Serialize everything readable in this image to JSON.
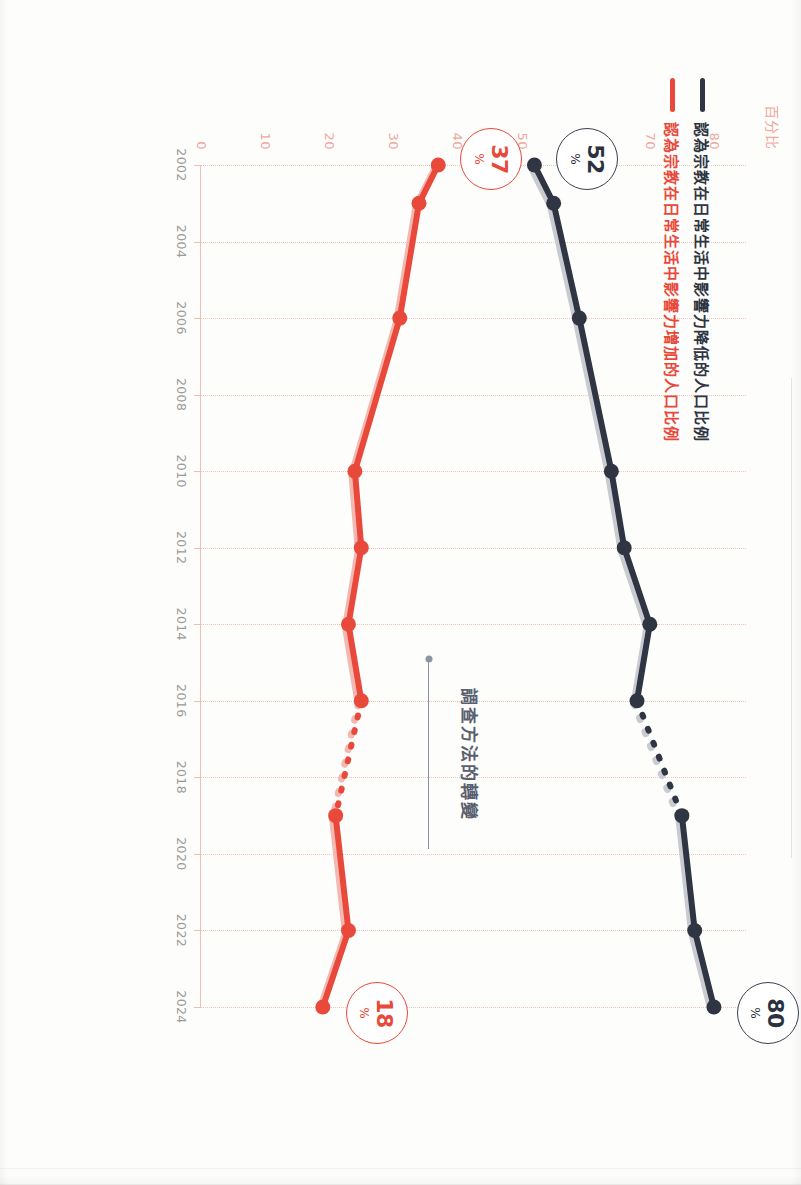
{
  "chart_data": {
    "type": "line",
    "title": "",
    "xlabel": "",
    "ylabel": "百分比",
    "ylim": [
      0,
      85
    ],
    "grid": true,
    "legend_position": "top-left",
    "x_tick_labels": [
      "2002",
      "2004",
      "2006",
      "2008",
      "2010",
      "2012",
      "2014",
      "2016",
      "2018",
      "2020",
      "2022",
      "2024"
    ],
    "y_tick_labels": [
      "0",
      "10",
      "20",
      "30",
      "40",
      "50",
      "60",
      "70",
      "80"
    ],
    "y_tick_values": [
      0,
      10,
      20,
      30,
      40,
      50,
      60,
      70,
      80
    ],
    "annotation": {
      "text": "調查方法的轉變",
      "x": 2017.4
    },
    "series": [
      {
        "name": "認為宗教在日常生活中影響力降低的人口比例",
        "color": "#2f3542",
        "points": [
          {
            "x": 2002,
            "y": 52
          },
          {
            "x": 2003,
            "y": 55
          },
          {
            "x": 2006,
            "y": 59
          },
          {
            "x": 2010,
            "y": 64
          },
          {
            "x": 2012,
            "y": 66
          },
          {
            "x": 2014,
            "y": 70
          },
          {
            "x": 2016,
            "y": 68
          },
          {
            "x": 2019,
            "y": 75
          },
          {
            "x": 2022,
            "y": 77
          },
          {
            "x": 2024,
            "y": 80
          }
        ],
        "break_between": [
          2016,
          2019
        ]
      },
      {
        "name": "認為宗教在日常生活中影響力增加的人口比例",
        "color": "#e8493a",
        "points": [
          {
            "x": 2002,
            "y": 37
          },
          {
            "x": 2003,
            "y": 34
          },
          {
            "x": 2006,
            "y": 31
          },
          {
            "x": 2010,
            "y": 24
          },
          {
            "x": 2012,
            "y": 25
          },
          {
            "x": 2014,
            "y": 23
          },
          {
            "x": 2016,
            "y": 25
          },
          {
            "x": 2019,
            "y": 21
          },
          {
            "x": 2022,
            "y": 23
          },
          {
            "x": 2024,
            "y": 19
          }
        ],
        "break_between": [
          2016,
          2019
        ]
      }
    ]
  },
  "legend": {
    "dark": {
      "label": "認為宗教在日常生活中影響力降低的人口比例",
      "color": "#2f3542"
    },
    "red": {
      "label": "認為宗教在日常生活中影響力增加的人口比例",
      "color": "#e8493a"
    }
  },
  "axis": {
    "y_title": "百分比",
    "y_ticks": [
      "0",
      "10",
      "20",
      "30",
      "40",
      "50",
      "60",
      "70",
      "80"
    ],
    "x_ticks": [
      "2002",
      "2004",
      "2006",
      "2008",
      "2010",
      "2012",
      "2014",
      "2016",
      "2018",
      "2020",
      "2022",
      "2024"
    ],
    "tick_color": "#f0a79c"
  },
  "callouts": {
    "start_red": {
      "value": "37",
      "unit": "%",
      "color": "#e8493a"
    },
    "start_dark": {
      "value": "52",
      "unit": "%",
      "color": "#2f3542"
    },
    "end_red": {
      "value": "18",
      "unit": "%",
      "color": "#e8493a"
    },
    "end_dark": {
      "value": "80",
      "unit": "%",
      "color": "#2f3542"
    }
  },
  "annotation": {
    "text": "調查方法的轉變"
  }
}
